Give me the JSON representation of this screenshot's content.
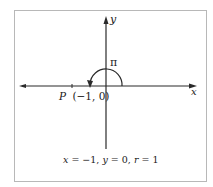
{
  "figure": {
    "axes": {
      "x_label": "x",
      "y_label": "y"
    },
    "angle_label": "π",
    "point": {
      "name": "P",
      "coords": "(−1, 0)"
    },
    "caption": {
      "x_part": "x",
      "x_val": " = −1, ",
      "y_part": "y",
      "y_val": " = 0,  ",
      "r_part": "r",
      "r_val": " = 1"
    },
    "colors": {
      "line": "#2a2a2a",
      "frame": "#b0b0b0",
      "text": "#1a1a1a"
    }
  }
}
